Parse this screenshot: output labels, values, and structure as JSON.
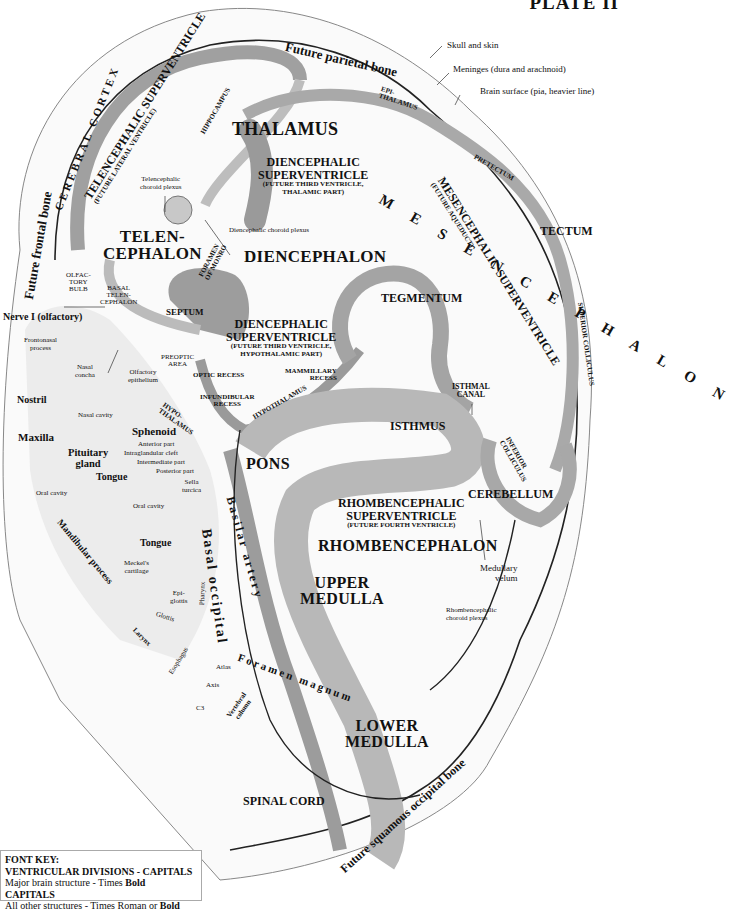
{
  "plate": {
    "title": "PLATE II"
  },
  "bones": {
    "parietal": "Future parietal bone",
    "frontal": "Future frontal bone",
    "squamous_occipital": "Future squamous occipital bone",
    "basal_occipital": "Basal occipital",
    "sphenoid": "Sphenoid",
    "maxilla": "Maxilla"
  },
  "coverings": {
    "skull": "Skull and skin",
    "meninges": "Meninges (dura and arachnoid)",
    "brain_surface": "Brain surface (pia, heavier line)"
  },
  "major_structures": {
    "telencephalon": [
      "TELEN-",
      "CEPHALON"
    ],
    "diencephalon": "DIENCEPHALON",
    "mesencephalon": "M E S E N C E P H A L O N",
    "rhombencephalon": "RHOMBENCEPHALON",
    "thalamus": "THALAMUS",
    "tegmentum": "TEGMENTUM",
    "tectum": "TECTUM",
    "isthmus": "ISTHMUS",
    "pons": "PONS",
    "cerebellum": "CEREBELLUM",
    "upper_medulla": [
      "UPPER",
      "MEDULLA"
    ],
    "lower_medulla": [
      "LOWER",
      "MEDULLA"
    ],
    "spinal_cord": "SPINAL CORD",
    "septum": "SEPTUM",
    "cerebral_cortex": "CEREBRAL CORTEX"
  },
  "ventricles": {
    "telencephalic": {
      "title": "TELENCEPHALIC SUPERVENTRICLE",
      "sub": "(FUTURE LATERAL VENTRICLE)"
    },
    "diencephalic_thalamic": {
      "title": [
        "DIENCEPHALIC",
        "SUPERVENTRICLE"
      ],
      "sub": [
        "(FUTURE THIRD VENTRICLE,",
        "THALAMIC PART)"
      ]
    },
    "diencephalic_hypothalamic": {
      "title": [
        "DIENCEPHALIC",
        "SUPERVENTRICLE"
      ],
      "sub": [
        "(FUTURE THIRD VENTRICLE,",
        "HYPOTHALAMIC PART)"
      ]
    },
    "mesencephalic": {
      "title": "MESENCEPHALIC SUPERVENTRICLE",
      "sub": "(FUTURE AQUEDUCT)"
    },
    "rhombencephalic": {
      "title": [
        "RHOMBENCEPHALIC",
        "SUPERVENTRICLE"
      ],
      "sub": "(FUTURE FOURTH VENTRICLE)"
    },
    "isthmal_canal": [
      "ISTHMAL",
      "CANAL"
    ]
  },
  "minor_structures": {
    "hippocampus": "HIPPOCAMPUS",
    "epithalamus": [
      "EPI-",
      "THALAMUS"
    ],
    "pretectum": "PRETECTUM",
    "superior_colliculus": "SUPERIOR COLLICULUS",
    "inferior_colliculus": [
      "INFERIOR",
      "COLLICULUS"
    ],
    "hypothalamus_small": [
      "HYPO-",
      "THALAMUS"
    ],
    "hypothalamus_long": "HYPOTHALAMUS",
    "foramen_monro": [
      "FORAMEN",
      "OF MONRO"
    ],
    "olfactory_bulb": [
      "OLFAC-",
      "TORY",
      "BULB"
    ],
    "basal_telencephalon": [
      "BASAL",
      "TELEN-",
      "CEPHALON"
    ],
    "preoptic_area": [
      "PREOPTIC",
      "AREA"
    ],
    "optic_recess": "OPTIC RECESS",
    "infundibular_recess": [
      "INFUNDIBULAR",
      "RECESS"
    ],
    "mammillary_recess": [
      "MAMMILLARY",
      "RECESS"
    ]
  },
  "annotations": {
    "telencephalic_choroid": [
      "Telencephalic",
      "choroid plexus"
    ],
    "diencephalic_choroid": "Diencephalic choroid plexus",
    "nerve_i": "Nerve I (olfactory)",
    "frontonasal": [
      "Frontonasal",
      "process"
    ],
    "nasal_concha": [
      "Nasal",
      "concha"
    ],
    "olfactory_epithelium": [
      "Olfactory",
      "epithelium"
    ],
    "nostril": "Nostril",
    "nasal_cavity": "Nasal cavity",
    "pituitary": [
      "Pituitary",
      "gland"
    ],
    "anterior_part": "Anterior part",
    "intraglandular_cleft": "Intraglandular cleft",
    "intermediate_part": "Intermediate part",
    "posterior_part": "Posterior part",
    "sella_turcica": [
      "Sella",
      "turcica"
    ],
    "tongue_upper": "Tongue",
    "tongue_lower": "Tongue",
    "oral_cavity_left": "Oral cavity",
    "oral_cavity_mid": "Oral cavity",
    "mandibular_process": "Mandibular process",
    "meckels": [
      "Meckel's",
      "cartilage"
    ],
    "epiglottis": [
      "Epi-",
      "glottis"
    ],
    "glottis": "Glottis",
    "pharynx": "Pharynx",
    "larynx": "Larynx",
    "esophagus": "Esophagus",
    "atlas": "Atlas",
    "axis": "Axis",
    "c3": "C3",
    "vertebral_column": [
      "Vertebral",
      "column"
    ],
    "foramen_magnum": "Foramen magnum",
    "basilar_artery": "Basilar artery",
    "medullary_velum": [
      "Medullary",
      "velum"
    ],
    "rhombencephalic_choroid": [
      "Rhombencephalic",
      "choroid plexus"
    ]
  },
  "font_key": {
    "heading": "FONT KEY:",
    "line1": "VENTRICULAR DIVISIONS  -  CAPITALS",
    "line2_prefix": "Major brain structure - Times ",
    "line2_bold": "Bold CAPITALS",
    "line3_prefix": "All other structures - Times Roman or ",
    "line3_bold": "Bold"
  },
  "colors": {
    "tissue": "#9a9a9a",
    "tissue_light": "#cfcfcf",
    "outline": "#222222",
    "background": "#ffffff"
  }
}
